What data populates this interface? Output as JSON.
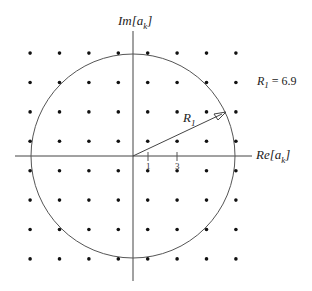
{
  "diagram": {
    "axes": {
      "imag_label": "Im[a",
      "imag_sub": "k",
      "imag_close": "]",
      "real_label": "Re[a",
      "real_sub": "k",
      "real_close": "]"
    },
    "ticks": [
      "1",
      "3"
    ],
    "radius_label": "R",
    "radius_sub": "1",
    "radius_value_label": "R",
    "radius_value_sub": "1",
    "radius_value_text": " = 6.9",
    "grid": {
      "columns": [
        -7,
        -5,
        -3,
        -1,
        1,
        3,
        5,
        7
      ],
      "rows": [
        7,
        5,
        3,
        1,
        -1,
        -3,
        -5,
        -7
      ],
      "point_count": 64
    },
    "circle_radius": 6.9
  }
}
